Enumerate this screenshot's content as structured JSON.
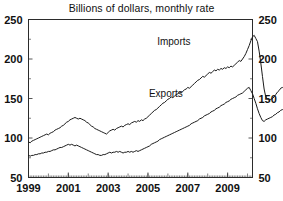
{
  "chart_data": {
    "type": "line",
    "title": "Billions of dollars, monthly rate",
    "subtitle": "",
    "xlabel": "",
    "ylabel": "",
    "ylim": [
      50,
      250
    ],
    "xlim": [
      1999.0,
      2010.25
    ],
    "y_ticks": [
      50,
      100,
      150,
      200,
      250
    ],
    "y_tick_labels": [
      "50",
      "100",
      "150",
      "200",
      "250"
    ],
    "y_minor_ticks": [
      75,
      125,
      175,
      225
    ],
    "x_ticks": [
      1999,
      2001,
      2003,
      2005,
      2007,
      2009
    ],
    "x_tick_labels": [
      "1999",
      "2001",
      "2003",
      "2005",
      "2007",
      "2009"
    ],
    "x_minor_tick_interval_months": 1,
    "grid": false,
    "legend_position": "inline-annotations",
    "dual_y_axis": true,
    "right_axis_mirrors_left": true,
    "annotations": [
      {
        "text": "Imports",
        "x": 2006.3,
        "y": 218
      },
      {
        "text": "Exports",
        "x": 2005.9,
        "y": 152
      }
    ],
    "series": [
      {
        "name": "Imports",
        "color": "#1a1a1a",
        "x_start": 1999.0,
        "x_step": 0.0833333,
        "values": [
          95,
          94,
          96,
          97,
          98,
          99,
          100,
          101,
          102,
          103,
          104,
          105,
          104,
          106,
          107,
          108,
          110,
          111,
          112,
          113,
          115,
          116,
          118,
          120,
          121,
          123,
          124,
          125,
          126,
          125,
          124,
          125,
          124,
          123,
          122,
          120,
          119,
          117,
          115,
          114,
          112,
          111,
          110,
          109,
          108,
          107,
          106,
          105,
          107,
          109,
          110,
          111,
          110,
          112,
          113,
          114,
          115,
          114,
          116,
          117,
          118,
          117,
          119,
          120,
          121,
          120,
          122,
          121,
          123,
          122,
          124,
          125,
          127,
          129,
          131,
          133,
          135,
          136,
          138,
          140,
          142,
          144,
          145,
          147,
          149,
          150,
          152,
          151,
          153,
          155,
          156,
          158,
          157,
          159,
          161,
          162,
          164,
          163,
          165,
          167,
          169,
          171,
          173,
          174,
          176,
          178,
          177,
          179,
          181,
          183,
          182,
          184,
          186,
          185,
          187,
          186,
          188,
          187,
          189,
          188,
          190,
          189,
          191,
          190,
          192,
          194,
          196,
          198,
          197,
          200,
          203,
          207,
          212,
          217,
          223,
          228,
          230,
          226,
          222,
          210,
          195,
          178,
          162,
          152,
          149,
          148,
          149,
          150,
          152,
          155,
          158,
          160,
          163,
          164,
          162,
          165,
          168,
          170,
          172,
          175,
          178,
          180
        ]
      },
      {
        "name": "Exports",
        "color": "#1a1a1a",
        "x_start": 1999.0,
        "x_step": 0.0833333,
        "values": [
          78,
          77,
          78,
          78,
          79,
          79,
          80,
          80,
          81,
          81,
          82,
          82,
          83,
          83,
          84,
          85,
          85,
          86,
          87,
          88,
          88,
          89,
          90,
          91,
          92,
          91,
          92,
          91,
          90,
          91,
          90,
          89,
          88,
          87,
          86,
          85,
          84,
          83,
          82,
          81,
          80,
          79,
          79,
          78,
          78,
          79,
          79,
          80,
          81,
          82,
          81,
          82,
          82,
          83,
          82,
          83,
          82,
          81,
          82,
          82,
          83,
          82,
          83,
          82,
          83,
          84,
          83,
          84,
          85,
          86,
          87,
          88,
          89,
          90,
          92,
          93,
          94,
          95,
          96,
          98,
          99,
          100,
          101,
          102,
          103,
          104,
          105,
          106,
          107,
          108,
          109,
          110,
          111,
          112,
          113,
          114,
          115,
          116,
          118,
          119,
          120,
          121,
          122,
          124,
          125,
          126,
          128,
          129,
          130,
          131,
          133,
          134,
          135,
          137,
          138,
          139,
          141,
          142,
          143,
          145,
          146,
          147,
          149,
          150,
          151,
          152,
          154,
          155,
          156,
          157,
          159,
          161,
          163,
          164,
          160,
          156,
          150,
          144,
          137,
          131,
          126,
          122,
          121,
          123,
          124,
          125,
          126,
          127,
          129,
          130,
          132,
          133,
          135,
          136,
          135,
          137,
          138,
          139,
          140,
          141,
          142,
          143
        ]
      }
    ]
  }
}
